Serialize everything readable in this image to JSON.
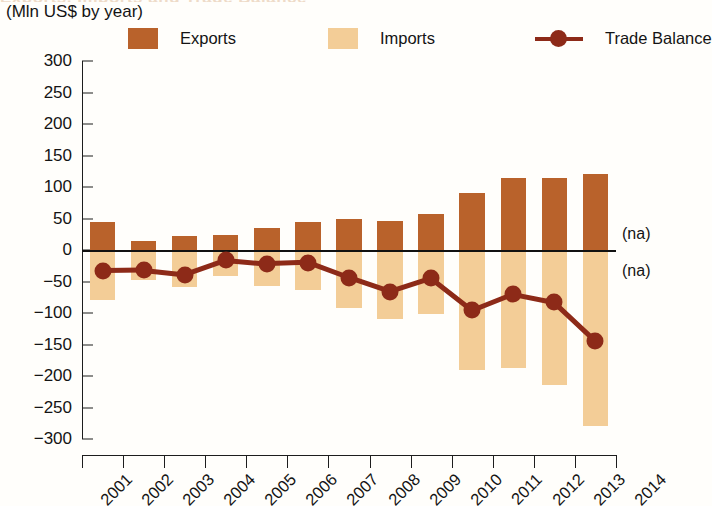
{
  "title_remnant": "Exports, Imports and Trade Balance",
  "subtitle": "(Mln US$ by year)",
  "legend": {
    "exports": "Exports",
    "imports": "Imports",
    "trade_balance": "Trade Balance"
  },
  "colors": {
    "exports": "#b9622b",
    "imports": "#f3cd97",
    "trade_balance": "#8d2a18",
    "axis": "#1d1d1d",
    "background": "#fffefb"
  },
  "annotations": [
    {
      "text": "(na)",
      "value": 25
    },
    {
      "text": "(na)",
      "value": -33
    }
  ],
  "chart_data": {
    "type": "bar",
    "title": "Exports, Imports and Trade Balance",
    "subtitle": "(Mln US$ by year)",
    "xlabel": "",
    "ylabel": "Mln US$",
    "ylim": [
      -300,
      300
    ],
    "ytick_values": [
      300,
      250,
      200,
      150,
      100,
      50,
      0,
      -50,
      -100,
      -150,
      -200,
      -250,
      -300
    ],
    "ytick_labels": [
      "300",
      "250",
      "200",
      "150",
      "100",
      "50",
      "0",
      "-50",
      "-100",
      "-150",
      "-200",
      "-250",
      "-300"
    ],
    "categories": [
      "2001",
      "2002",
      "2003",
      "2004",
      "2005",
      "2006",
      "2007",
      "2008",
      "2009",
      "2010",
      "2011",
      "2012",
      "2013"
    ],
    "xtick_labels": [
      "2001",
      "2002",
      "2003",
      "2004",
      "2005",
      "2006",
      "2007",
      "2008",
      "2009",
      "2010",
      "2011",
      "2012",
      "2013",
      "2014"
    ],
    "grid": false,
    "legend_position": "top",
    "series": [
      {
        "name": "Exports",
        "type": "bar",
        "color": "#b9622b",
        "values": [
          45,
          15,
          22,
          24,
          35,
          45,
          50,
          46,
          57,
          90,
          115,
          115,
          120
        ]
      },
      {
        "name": "Imports",
        "type": "bar",
        "color": "#f3cd97",
        "values": [
          -80,
          -48,
          -58,
          -42,
          -57,
          -64,
          -92,
          -110,
          -102,
          -190,
          -188,
          -215,
          -280
        ]
      },
      {
        "name": "Trade Balance",
        "type": "line",
        "color": "#8d2a18",
        "values": [
          -33,
          -32,
          -39,
          -16,
          -22,
          -20,
          -44,
          -66,
          -45,
          -96,
          -70,
          -83,
          -144
        ]
      }
    ]
  }
}
